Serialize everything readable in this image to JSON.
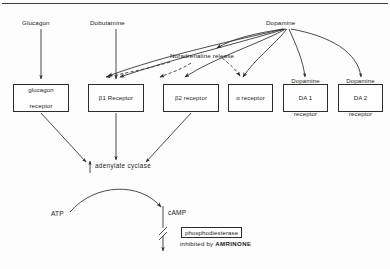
{
  "figure": {
    "title_rule": true,
    "agonists": [
      {
        "id": "glucagon",
        "label": "Glucagon",
        "x": 22,
        "y": 19
      },
      {
        "id": "dobutamine",
        "label": "Dobutamine",
        "x": 90,
        "y": 19
      },
      {
        "id": "dopamine",
        "label": "Dopamine",
        "x": 266,
        "y": 19
      }
    ],
    "mediator": {
      "id": "noradrenaline-release",
      "label": "Noradrenaline release",
      "x": 170,
      "y": 55
    },
    "receptors": [
      {
        "id": "glucagon-receptor",
        "lines": [
          "glucagon",
          "receptor"
        ],
        "x": 13,
        "y": 84,
        "w": 56,
        "h": 28
      },
      {
        "id": "beta1-receptor",
        "lines": [
          "β1  Receptor"
        ],
        "x": 88,
        "y": 84,
        "w": 56,
        "h": 28
      },
      {
        "id": "beta2-receptor",
        "lines": [
          "β2   receptor"
        ],
        "x": 163,
        "y": 84,
        "w": 56,
        "h": 28
      },
      {
        "id": "alpha-receptor",
        "lines": [
          "α  receptor"
        ],
        "x": 228,
        "y": 84,
        "w": 45,
        "h": 28
      },
      {
        "id": "dopamine-da1-receptor",
        "lines": [
          "Dopamine",
          "DA 1",
          "receptor"
        ],
        "x": 283,
        "y": 84,
        "w": 45,
        "h": 28
      },
      {
        "id": "dopamine-da2-receptor",
        "lines": [
          "Dopamine",
          "DA 2",
          "receptor"
        ],
        "x": 338,
        "y": 84,
        "w": 45,
        "h": 28
      }
    ],
    "enzyme": {
      "id": "adenylate-cyclase",
      "label": "adenylate  cyclase",
      "increase_marker": "↑",
      "x": 90,
      "y": 162
    },
    "substrates": [
      {
        "id": "atp",
        "label": "ATP",
        "x": 51,
        "y": 212
      },
      {
        "id": "camp",
        "label": "cAMP",
        "x": 166,
        "y": 211
      }
    ],
    "phosphodiesterase": {
      "id": "phosphodiesterase",
      "label": "phosphodiesterase",
      "x": 205,
      "y": 233
    },
    "inhibition_note": {
      "prefix": "inhibited by",
      "drug": "AMRINONE",
      "x": 203,
      "y": 246
    },
    "colors": {
      "stroke": "#2b2b2b",
      "text": "#1d1d1d",
      "background": "#fdfdfd",
      "rule": "#3d3d3d"
    }
  }
}
